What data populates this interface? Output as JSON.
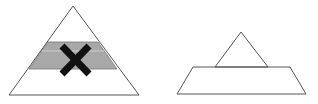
{
  "diagram": {
    "left": {
      "label": "pyramid-with-removed-middle-layer",
      "outline_color": "#555555",
      "band_color": "#a8a8a8",
      "band_line_color": "#c8c8c8",
      "cross_color": "#111111"
    },
    "right": {
      "label": "small-triangle-on-trapezoid",
      "outline_color": "#555555"
    }
  }
}
